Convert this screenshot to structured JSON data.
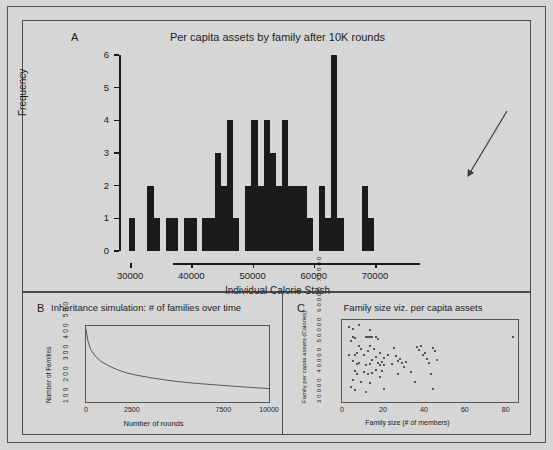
{
  "figure": {
    "background_color": "#d6d6d6",
    "ink_color": "#1b1b1b"
  },
  "panel_a": {
    "letter": "A",
    "title": "Per capita assets by family after 10K rounds"
  },
  "panel_b": {
    "letter": "B",
    "title": "Inheritance simulation: # of families over time"
  },
  "panel_c": {
    "letter": "C",
    "title": "Family size viz. per capita assets"
  },
  "chart_data": [
    {
      "type": "bar",
      "panel": "A",
      "title": "Per capita assets by family after 10K rounds",
      "xlabel": "Individual Calorie Stash",
      "ylabel": "Frequency",
      "xlim": [
        29000,
        78000
      ],
      "ylim": [
        0,
        6
      ],
      "xticks": [
        30000,
        40000,
        50000,
        60000,
        70000
      ],
      "xtick_labels": [
        "30000",
        "40000",
        "50000",
        "60000",
        "70000"
      ],
      "yticks": [
        0,
        1,
        2,
        3,
        4,
        5,
        6
      ],
      "ytick_labels": [
        "0",
        "1",
        "2",
        "3",
        "4",
        "5",
        "6"
      ],
      "grid": false,
      "bin_width": 1000,
      "bin_starts": [
        29800,
        30800,
        31800,
        32800,
        33800,
        34800,
        35800,
        36800,
        37800,
        38800,
        39800,
        40800,
        41800,
        42800,
        43800,
        44800,
        45800,
        46800,
        47800,
        48800,
        49800,
        50800,
        51800,
        52800,
        53800,
        54800,
        55800,
        56800,
        57800,
        58800,
        59800,
        60800,
        61800,
        62800,
        63800,
        64800,
        65800,
        66800,
        67800,
        68800,
        69800,
        70800,
        71800,
        72800,
        73800,
        74800,
        75800,
        76800
      ],
      "values": [
        1,
        0,
        0,
        2,
        1,
        0,
        1,
        1,
        0,
        1,
        1,
        0,
        1,
        1,
        3,
        2,
        4,
        1,
        0,
        2,
        4,
        2,
        4,
        3,
        2,
        4,
        2,
        2,
        2,
        1,
        0,
        2,
        1,
        6,
        1,
        0,
        0,
        0,
        2,
        1,
        0,
        0,
        0,
        0,
        0,
        0,
        0,
        0
      ],
      "annotation": {
        "type": "arrow",
        "points_to": "rightmost bars near 76000",
        "from": [
          482,
          92
        ],
        "to": [
          442,
          158
        ]
      }
    },
    {
      "type": "line",
      "panel": "B",
      "title": "Inheritance simulation: # of families over time",
      "xlabel": "Number of rounds",
      "ylabel": "Number of Families",
      "xlim": [
        0,
        10000
      ],
      "ylim": [
        0,
        520
      ],
      "xticks": [
        0,
        2500,
        7500,
        10000
      ],
      "xtick_labels": [
        "0",
        "2500",
        "7500",
        "10000"
      ],
      "ytick_labels": "100 200 300 400 500",
      "grid": false,
      "x": [
        0,
        100,
        250,
        500,
        800,
        1200,
        1700,
        2200,
        2800,
        3500,
        4200,
        5000,
        5800,
        6600,
        7400,
        8200,
        9000,
        10000
      ],
      "y": [
        500,
        420,
        360,
        315,
        280,
        250,
        222,
        200,
        183,
        167,
        153,
        140,
        130,
        122,
        114,
        107,
        100,
        92
      ]
    },
    {
      "type": "scatter",
      "panel": "C",
      "title": "Family size viz. per capita assets",
      "xlabel": "Family size (# of members)",
      "ylabel": "Family per capita assets (Calories)",
      "xlim": [
        0,
        86
      ],
      "ylim": [
        28000,
        78000
      ],
      "xticks": [
        0,
        20,
        40,
        60,
        80
      ],
      "xtick_labels": [
        "0",
        "20",
        "40",
        "60",
        "80"
      ],
      "ytick_labels": "30000 40000 50000 60000 70000",
      "grid": false,
      "points": [
        [
          3,
          74500
        ],
        [
          5,
          73000
        ],
        [
          8,
          75500
        ],
        [
          13,
          72500
        ],
        [
          4,
          66000
        ],
        [
          5,
          68500
        ],
        [
          6,
          67500
        ],
        [
          11,
          68000
        ],
        [
          12,
          68500
        ],
        [
          13,
          68300
        ],
        [
          14,
          68000
        ],
        [
          16,
          68500
        ],
        [
          17,
          67000
        ],
        [
          13,
          63000
        ],
        [
          8,
          62500
        ],
        [
          9,
          61000
        ],
        [
          3,
          57500
        ],
        [
          6,
          57000
        ],
        [
          7,
          58500
        ],
        [
          10,
          57000
        ],
        [
          12,
          60000
        ],
        [
          15,
          61000
        ],
        [
          16,
          56000
        ],
        [
          18,
          58500
        ],
        [
          20,
          55500
        ],
        [
          5,
          53500
        ],
        [
          7,
          52000
        ],
        [
          8,
          52500
        ],
        [
          11,
          51000
        ],
        [
          13,
          52000
        ],
        [
          14,
          54000
        ],
        [
          17,
          52500
        ],
        [
          18,
          51000
        ],
        [
          19,
          53000
        ],
        [
          20,
          51500
        ],
        [
          6,
          47500
        ],
        [
          7,
          46000
        ],
        [
          10,
          47000
        ],
        [
          12,
          45500
        ],
        [
          14,
          46500
        ],
        [
          16,
          48000
        ],
        [
          19,
          47500
        ],
        [
          5,
          42000
        ],
        [
          9,
          41000
        ],
        [
          13,
          40500
        ],
        [
          4,
          37500
        ],
        [
          6,
          36000
        ],
        [
          11,
          35000
        ],
        [
          22,
          57000
        ],
        [
          24,
          52000
        ],
        [
          25,
          61500
        ],
        [
          26,
          56500
        ],
        [
          27,
          53500
        ],
        [
          28,
          55000
        ],
        [
          29,
          52500
        ],
        [
          27,
          46000
        ],
        [
          30,
          50000
        ],
        [
          31,
          53000
        ],
        [
          33,
          47000
        ],
        [
          35,
          41000
        ],
        [
          36,
          62000
        ],
        [
          37,
          60500
        ],
        [
          38,
          63000
        ],
        [
          39,
          57500
        ],
        [
          40,
          58500
        ],
        [
          41,
          55000
        ],
        [
          42,
          52500
        ],
        [
          44,
          61500
        ],
        [
          45,
          59500
        ],
        [
          46,
          54500
        ],
        [
          43,
          45500
        ],
        [
          44,
          36500
        ],
        [
          20,
          36500
        ],
        [
          18,
          44000
        ],
        [
          83,
          68500
        ]
      ]
    }
  ]
}
